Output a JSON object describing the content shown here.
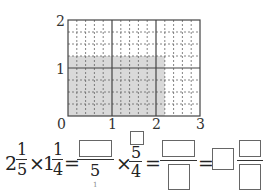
{
  "figure": {
    "type": "area-model grid",
    "x_axis": {
      "ticks": [
        "0",
        "1",
        "2",
        "3"
      ],
      "subdivisions_per_unit": 5
    },
    "y_axis": {
      "ticks": [
        "1",
        "2"
      ],
      "subdivisions_per_unit": 4
    },
    "shaded_region": {
      "width": "11/5",
      "height": "5/4",
      "color": "#d9d9d9"
    },
    "grid_line_color": "#555555"
  },
  "equation": {
    "mixed1": {
      "whole": "2",
      "num": "1",
      "den": "5"
    },
    "times1": "×",
    "mixed2": {
      "whole": "1",
      "num": "1",
      "den": "4"
    },
    "equals1": "=",
    "frac1": {
      "num": "",
      "den": "5",
      "den_mark": "1"
    },
    "times2": "×",
    "frac2": {
      "num_box": "",
      "num": "5",
      "den": "4"
    },
    "equals2": "=",
    "frac3": {
      "num": "",
      "den": ""
    },
    "equals3": "=",
    "result": {
      "whole": "",
      "num": "",
      "den": ""
    }
  }
}
